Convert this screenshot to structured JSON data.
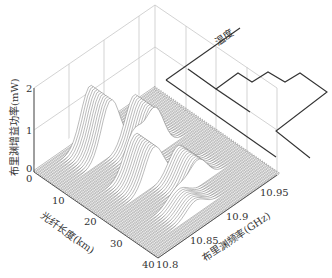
{
  "chart_data": {
    "type": "waterfall3d",
    "title": "",
    "xlabel": "光纤长度(km)",
    "ylabel": "布里渊频率(GHz)",
    "zlabel": "布里渊增益功率(mW)",
    "x_ticks": [
      "10",
      "20",
      "30",
      "40"
    ],
    "x_range": [
      0,
      40
    ],
    "y_ticks": [
      "10.8",
      "10.85",
      "10.9",
      "10.95"
    ],
    "y_range": [
      10.8,
      10.97
    ],
    "z_ticks": [
      "0",
      "1",
      "2"
    ],
    "z_range": [
      0,
      2
    ],
    "origin_labels": [
      "0",
      "0"
    ],
    "temperature_label": "温度",
    "grid": true,
    "peaks": [
      {
        "fiber_km_range": [
          2,
          9
        ],
        "freq_GHz": 10.87,
        "gain_mW": 1.3
      },
      {
        "fiber_km_range": [
          9,
          16
        ],
        "freq_GHz": 10.9,
        "gain_mW": 1.1
      },
      {
        "fiber_km_range": [
          16,
          23
        ],
        "freq_GHz": 10.87,
        "gain_mW": 0.9
      },
      {
        "fiber_km_range": [
          23,
          30
        ],
        "freq_GHz": 10.9,
        "gain_mW": 0.6
      },
      {
        "fiber_km_range": [
          30,
          36
        ],
        "freq_GHz": 10.87,
        "gain_mW": 0.3
      }
    ],
    "temperature_profile": {
      "description": "step profile of temperature along fiber, alternating high/low segments",
      "segments": [
        "low",
        "high",
        "low",
        "high",
        "low",
        "high",
        "low"
      ]
    }
  },
  "axes": {
    "z_tick_2": "2",
    "z_tick_1": "1",
    "z_tick_0a": "0",
    "z_tick_0b": "0",
    "x_tick_10": "10",
    "x_tick_20": "20",
    "x_tick_30": "30",
    "x_tick_40": "40",
    "y_tick_1080": "10.8",
    "y_tick_1085": "10.85",
    "y_tick_1090": "10.9",
    "y_tick_1095": "10.95",
    "xlabel": "光纤长度(km)",
    "ylabel": "布里渊频率(GHz)",
    "zlabel": "布里渊增益功率(mW)",
    "temp_label": "温度"
  }
}
